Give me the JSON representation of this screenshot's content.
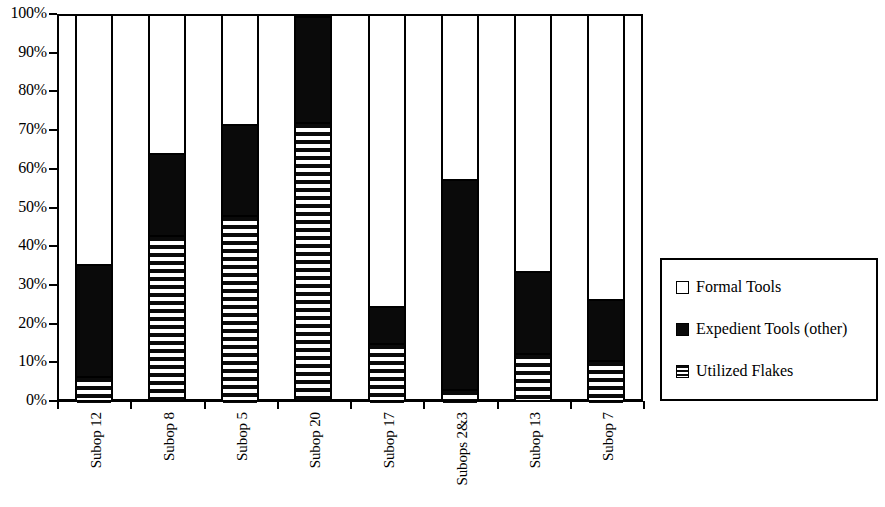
{
  "chart_data": {
    "type": "bar",
    "subtype": "stacked-100-percent",
    "title": "",
    "xlabel": "",
    "ylabel": "",
    "ylim": [
      0,
      100
    ],
    "ytick_labels": [
      "100%",
      "90%",
      "80%",
      "70%",
      "60%",
      "50%",
      "40%",
      "30%",
      "20%",
      "10%",
      "0%"
    ],
    "ytick_values": [
      100,
      90,
      80,
      70,
      60,
      50,
      40,
      30,
      20,
      10,
      0
    ],
    "grid": false,
    "legend_position": "right",
    "categories": [
      "Subop 12",
      "Subop 8",
      "Subop 5",
      "Subop 20",
      "Subop 17",
      "Subops 2&3",
      "Subop 13",
      "Subop 7"
    ],
    "series": [
      {
        "name": "Utilized Flakes",
        "pattern": "horizontal-stripes",
        "color": "#0a0a0a",
        "values": [
          7,
          43.5,
          48.5,
          72.5,
          15.5,
          3.5,
          13,
          11
        ]
      },
      {
        "name": "Expedient Tools (other)",
        "pattern": "solid",
        "color": "#0a0a0a",
        "values": [
          29,
          21,
          23.5,
          27.5,
          9.5,
          54.5,
          21,
          16
        ]
      },
      {
        "name": "Formal Tools",
        "pattern": "empty",
        "color": "#ffffff",
        "values": [
          64,
          35.5,
          28,
          0,
          75,
          42,
          66,
          73
        ]
      }
    ],
    "cumulative_tops": {
      "utilized_flakes": [
        7,
        43.5,
        48.5,
        72.5,
        15.5,
        3.5,
        13,
        11
      ],
      "expedient_tools": [
        36,
        64.5,
        72,
        100,
        25,
        58,
        34,
        27
      ],
      "formal_tools": [
        100,
        100,
        100,
        100,
        100,
        100,
        100,
        100
      ]
    }
  },
  "legend": {
    "items": [
      {
        "label": "Formal Tools",
        "swatch": "empty-box-icon"
      },
      {
        "label": "Expedient Tools (other)",
        "swatch": "solid-box-icon"
      },
      {
        "label": "Utilized Flakes",
        "swatch": "striped-box-icon"
      }
    ]
  }
}
